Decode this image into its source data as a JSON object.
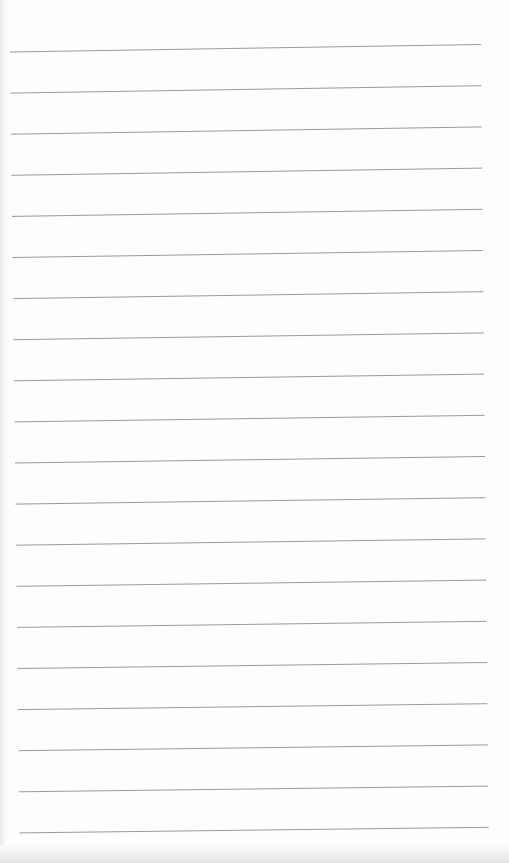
{
  "page": {
    "type": "lined-paper",
    "line_count": 20,
    "line_color": "#9a9a9a",
    "background": "#fdfdfd",
    "text": []
  }
}
